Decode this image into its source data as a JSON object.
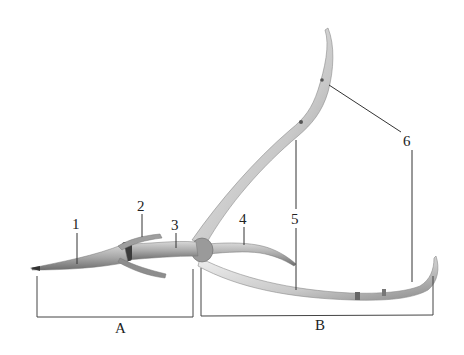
{
  "figure": {
    "labels": {
      "l1": "1",
      "l2": "2",
      "l3": "3",
      "l4": "4",
      "l5": "5",
      "l6": "6"
    },
    "brackets": {
      "a": "A",
      "b": "B"
    },
    "colors": {
      "bone_light": "#e2e2e2",
      "bone_mid": "#b5b5b5",
      "bone_dark": "#6f6f6f",
      "line": "#333333",
      "background": "#ffffff"
    }
  }
}
